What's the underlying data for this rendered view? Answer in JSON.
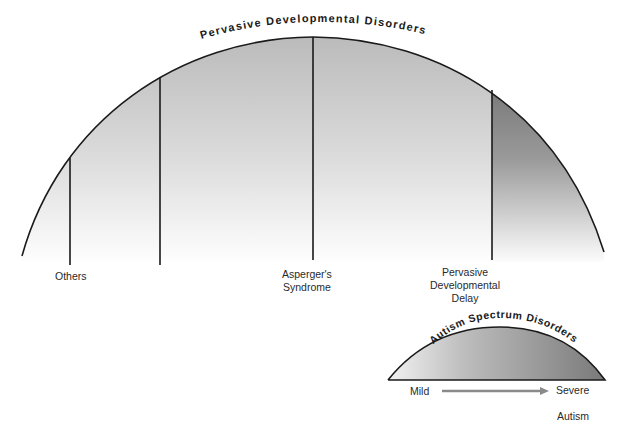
{
  "diagram": {
    "main_arc": {
      "title": "Pervasive Developmental Disorders",
      "segments": [
        {
          "label": "Others",
          "divider_x": 70
        },
        {
          "label": "",
          "divider_x": 160
        },
        {
          "label": "Asperger's\nSyndrome",
          "label_line1": "Asperger's",
          "label_line2": "Syndrome",
          "divider_x": 313
        },
        {
          "label": "Pervasive Developmental Delay",
          "label_line1": "Pervasive",
          "label_line2": "Developmental",
          "label_line3": "Delay",
          "divider_x": 492
        }
      ]
    },
    "spectrum_arc": {
      "title": "Autism Spectrum Disorders",
      "scale_start": "Mild",
      "scale_end": "Severe",
      "scale_end_sublabel": "Autism"
    },
    "colors": {
      "line": "#1a1a1a",
      "fill_light": "#f7f7f7",
      "fill_mid": "#c4c4c4",
      "fill_dark": "#6e6e6e",
      "arrow": "#8a8a8a"
    }
  }
}
